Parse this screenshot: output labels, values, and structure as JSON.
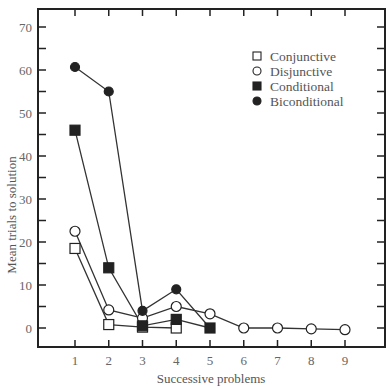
{
  "chart_data": {
    "type": "line",
    "title": "",
    "xlabel": "Successive problems",
    "ylabel": "Mean trials to solution",
    "x": [
      1,
      2,
      3,
      4,
      5,
      6,
      7,
      8,
      9
    ],
    "xticks": [
      "1",
      "2",
      "3",
      "4",
      "5",
      "6",
      "7",
      "8",
      "9"
    ],
    "yticks": [
      "0",
      "10",
      "20",
      "30",
      "40",
      "50",
      "60",
      "70"
    ],
    "ylim": [
      -4.4,
      74.2
    ],
    "xlim": [
      -0.1,
      10.2
    ],
    "grid": false,
    "legend_position": "upper right",
    "series": [
      {
        "name": "Conjunctive",
        "marker": "open-square",
        "x": [
          1,
          2,
          3,
          4
        ],
        "values": [
          18.5,
          0.8,
          0.2,
          0
        ]
      },
      {
        "name": "Disjunctive",
        "marker": "open-circle",
        "x": [
          1,
          2,
          3,
          4,
          5,
          6,
          7,
          8,
          9
        ],
        "values": [
          22.5,
          4.2,
          2.3,
          5,
          3.3,
          0,
          0,
          -0.2,
          -0.4
        ]
      },
      {
        "name": "Conditional",
        "marker": "filled-square",
        "x": [
          1,
          2,
          3,
          4,
          5
        ],
        "values": [
          46,
          14,
          0.5,
          2,
          0
        ]
      },
      {
        "name": "Biconditional",
        "marker": "filled-circle",
        "x": [
          1,
          2,
          3,
          4,
          5
        ],
        "values": [
          60.7,
          55,
          4,
          9,
          0
        ]
      }
    ]
  },
  "legend": {
    "items": [
      {
        "label": "Conjunctive",
        "marker": "open-square"
      },
      {
        "label": "Disjunctive",
        "marker": "open-circle"
      },
      {
        "label": "Conditional",
        "marker": "filled-square"
      },
      {
        "label": "Biconditional",
        "marker": "filled-circle"
      }
    ]
  },
  "colors": {
    "line": "#333333",
    "axis": "#222222",
    "marker_fill": "#222222",
    "open_fill": "#ffffff"
  }
}
